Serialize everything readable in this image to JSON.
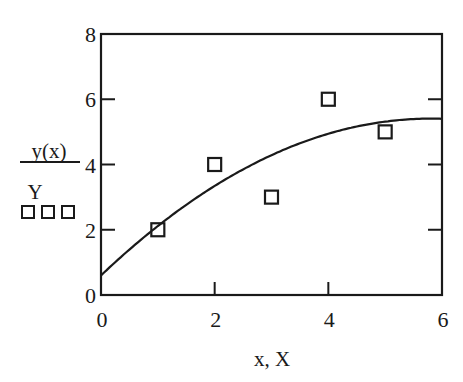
{
  "chart_data": {
    "type": "line+scatter",
    "title": "",
    "xlabel": "x, X",
    "ylabel": {
      "numerator": "y(x)",
      "denominator": "Y",
      "marker_legend": "□□□"
    },
    "xlim": [
      0,
      6
    ],
    "ylim": [
      0,
      8
    ],
    "x_ticks": [
      0,
      2,
      4,
      6
    ],
    "y_ticks": [
      0,
      2,
      4,
      6,
      8
    ],
    "x_tick_labels": [
      "0",
      "2",
      "4",
      "6"
    ],
    "y_tick_labels": [
      "0",
      "2",
      "4",
      "6",
      "8"
    ],
    "grid": false,
    "series": [
      {
        "name": "y(x)",
        "style": "solid-line",
        "color": "#1a1a1a",
        "fit": "quadratic least-squares",
        "coefficients": {
          "a": -0.142857,
          "b": 1.657143,
          "c": 0.6
        },
        "x": [
          0,
          0.5,
          1,
          1.5,
          2,
          2.5,
          3,
          3.5,
          4,
          4.5,
          5,
          5.5,
          5.8,
          6
        ],
        "values": [
          0.6,
          1.39,
          2.11,
          2.76,
          3.34,
          3.85,
          4.29,
          4.65,
          4.94,
          5.16,
          5.31,
          5.39,
          5.41,
          5.4
        ]
      },
      {
        "name": "Y",
        "style": "open-square-markers",
        "color": "#1a1a1a",
        "x": [
          1,
          2,
          3,
          4,
          5
        ],
        "values": [
          2,
          4,
          3,
          6,
          5
        ]
      }
    ]
  }
}
